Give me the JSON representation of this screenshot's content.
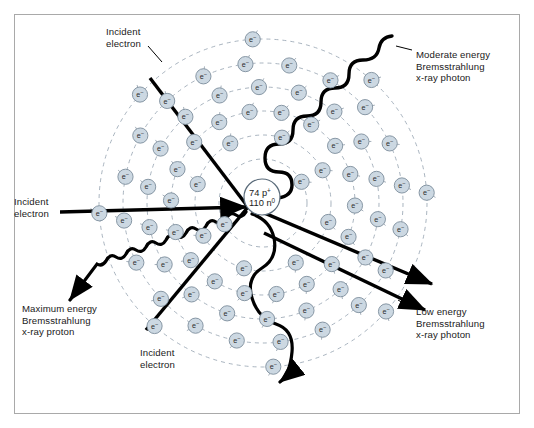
{
  "figure": {
    "background_color": "#ffffff",
    "border_color": "#a9a9a9"
  },
  "nucleus": {
    "protons_label": "74 p",
    "protons_sup": "+",
    "neutrons_label": "110 n",
    "neutrons_sup": "0",
    "center": [
      262,
      197
    ],
    "radius": 18,
    "stroke_color": "#5a6b7a"
  },
  "electron": {
    "symbol": "e",
    "charge_sup": "−",
    "fill_color": "#ccd8e2",
    "stroke_color": "#7d8d9c",
    "radius": 7.6,
    "count": 74
  },
  "shells": {
    "center": [
      263,
      203
    ],
    "stroke_color": "#9aa7b3",
    "dash": "4 4",
    "radii": [
      44,
      68,
      92,
      116,
      140,
      164
    ],
    "electron_counts": [
      2,
      8,
      18,
      18,
      20,
      8
    ]
  },
  "labels": [
    {
      "id": "incident-electron-top",
      "text": "Incident\nelectron",
      "x": 106,
      "y": 26
    },
    {
      "id": "incident-electron-left",
      "text": "Incident\nelectron",
      "x": 14,
      "y": 196
    },
    {
      "id": "incident-electron-bottom",
      "text": "Incident\nelectron",
      "x": 140,
      "y": 347
    },
    {
      "id": "moderate-energy-photon",
      "text": "Moderate energy\nBremsstrahlung\nx-ray photon",
      "x": 416,
      "y": 49
    },
    {
      "id": "maximum-energy-photon",
      "text": "Maximum energy\nBremsstrahlung\nx-ray proton",
      "x": 22,
      "y": 303
    },
    {
      "id": "low-energy-photon",
      "text": "Low energy\nBremsstrahlung\nx-ray photon",
      "x": 416,
      "y": 306
    }
  ],
  "interaction_point": [
    248,
    207
  ],
  "trajectories": [
    {
      "id": "incident-top",
      "name": "incident-electron-top-path",
      "from": [
        150,
        78
      ],
      "to": [
        248,
        207
      ],
      "kind": "line",
      "arrow": false
    },
    {
      "id": "incident-left",
      "name": "incident-electron-left-path",
      "from": [
        60,
        212
      ],
      "to": [
        248,
        207
      ],
      "kind": "line",
      "arrow": true
    },
    {
      "id": "incident-bottom",
      "name": "incident-electron-bottom-path",
      "from": [
        146,
        330
      ],
      "to": [
        248,
        207
      ],
      "kind": "line",
      "arrow": false
    },
    {
      "id": "scatter-upper-right",
      "name": "scattered-electron-upper-right",
      "from": [
        248,
        207
      ],
      "to": [
        437,
        287
      ],
      "kind": "line",
      "arrow": true
    },
    {
      "id": "scatter-lower-right",
      "name": "scattered-electron-lower-right",
      "from": [
        262,
        232
      ],
      "to": [
        430,
        313
      ],
      "kind": "line",
      "arrow": true
    }
  ],
  "photons": [
    {
      "id": "moderate",
      "name": "moderate-energy-photon-wave",
      "wavelength": "short",
      "amplitude": 13,
      "energy_rank": 2
    },
    {
      "id": "maximum",
      "name": "maximum-energy-photon-wave",
      "wavelength": "shortest",
      "amplitude": 8,
      "energy_rank": 1
    },
    {
      "id": "low",
      "name": "low-energy-photon-wave",
      "wavelength": "long",
      "amplitude": 17,
      "energy_rank": 3
    }
  ]
}
